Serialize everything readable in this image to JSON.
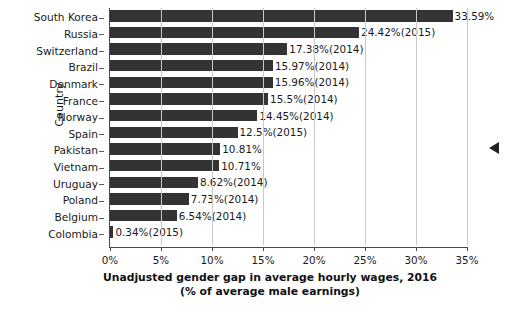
{
  "chart_data": {
    "type": "bar",
    "orientation": "horizontal",
    "title": "",
    "xlabel": "Unadjusted gender gap in average hourly wages, 2016",
    "xlabel_line2": "(% of average male earnings)",
    "ylabel": "Country",
    "xlim": [
      0,
      35
    ],
    "xticks": [
      0,
      5,
      10,
      15,
      20,
      25,
      30,
      35
    ],
    "xtick_labels": [
      "0%",
      "5%",
      "10%",
      "15%",
      "20%",
      "25%",
      "30%",
      "35%"
    ],
    "grid": "vertical",
    "legend": "none",
    "bar_color": "#333333",
    "categories": [
      "South Korea",
      "Russia",
      "Switzerland",
      "Brazil",
      "Denmark",
      "France",
      "Norway",
      "Spain",
      "Pakistan",
      "Vietnam",
      "Uruguay",
      "Poland",
      "Belgium",
      "Colombia"
    ],
    "values": [
      33.59,
      24.42,
      17.38,
      15.97,
      15.96,
      15.5,
      14.45,
      12.5,
      10.81,
      10.71,
      8.62,
      7.73,
      6.54,
      0.34
    ],
    "data_labels": [
      "33.59%",
      "24.42%(2015)",
      "17.38%(2014)",
      "15.97%(2014)",
      "15.96%(2014)",
      "15.5%(2014)",
      "14.45%(2014)",
      "12.5%(2015)",
      "10.81%",
      "10.71%",
      "8.62%(2014)",
      "7.73%(2014)",
      "6.54%(2014)",
      "0.34%(2015)"
    ]
  },
  "markers": {
    "edge_pointer": "left-pointing-triangle"
  }
}
